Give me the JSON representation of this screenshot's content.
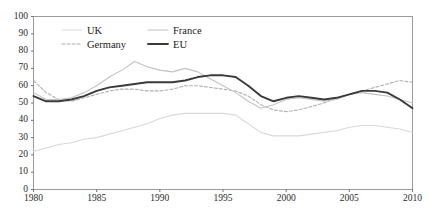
{
  "chart_data": {
    "type": "line",
    "title": "",
    "xlabel": "",
    "ylabel": "",
    "xlim": [
      1980,
      2010
    ],
    "ylim": [
      0,
      100
    ],
    "grid": false,
    "legend_position": "top-left-inside",
    "x_ticks": [
      "1980",
      "1985",
      "1990",
      "1995",
      "2000",
      "2005",
      "2010"
    ],
    "y_ticks": [
      "0",
      "10",
      "20",
      "30",
      "40",
      "50",
      "60",
      "70",
      "80",
      "90",
      "100"
    ],
    "x": [
      1980,
      1981,
      1982,
      1983,
      1984,
      1985,
      1986,
      1987,
      1988,
      1989,
      1990,
      1991,
      1992,
      1993,
      1994,
      1995,
      1996,
      1997,
      1998,
      1999,
      2000,
      2001,
      2002,
      2003,
      2004,
      2005,
      2006,
      2007,
      2008,
      2009,
      2010
    ],
    "series": [
      {
        "name": "UK",
        "color": "#d9d9d9",
        "style": "solid",
        "width": 1.1,
        "values": [
          22,
          24,
          26,
          27,
          29,
          30,
          32,
          34,
          36,
          38,
          41,
          43,
          44,
          44,
          44,
          44,
          43,
          38,
          33,
          31,
          31,
          31,
          32,
          33,
          34,
          36,
          37,
          37,
          36,
          35,
          33
        ]
      },
      {
        "name": "Germany",
        "color": "#b0b0b0",
        "style": "dashed",
        "width": 1.1,
        "values": [
          63,
          56,
          52,
          51,
          53,
          55,
          57,
          58,
          58,
          57,
          57,
          58,
          60,
          60,
          59,
          58,
          57,
          54,
          49,
          46,
          45,
          46,
          48,
          50,
          53,
          55,
          57,
          59,
          61,
          63,
          62
        ]
      },
      {
        "name": "France",
        "color": "#c2c2c2",
        "style": "solid",
        "width": 1.1,
        "values": [
          56,
          52,
          52,
          53,
          56,
          60,
          65,
          69,
          74,
          71,
          69,
          68,
          70,
          68,
          64,
          60,
          56,
          51,
          47,
          49,
          52,
          53,
          52,
          51,
          52,
          55,
          56,
          55,
          54,
          52,
          50
        ]
      },
      {
        "name": "EU",
        "color": "#3a3a3a",
        "style": "solid",
        "width": 1.9,
        "values": [
          54,
          51,
          51,
          52,
          54,
          57,
          59,
          60,
          61,
          62,
          62,
          62,
          63,
          65,
          66,
          66,
          65,
          60,
          54,
          51,
          53,
          54,
          53,
          52,
          53,
          55,
          57,
          57,
          56,
          52,
          47
        ]
      }
    ]
  }
}
